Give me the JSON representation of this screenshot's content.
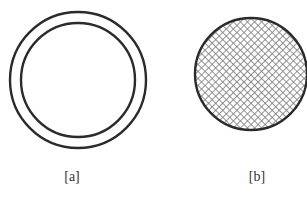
{
  "figures": [
    {
      "id": "a",
      "label": "[a]",
      "description": "two concentric unfilled circles",
      "outer_ring": {
        "cx": 78,
        "cy": 80,
        "r": 68
      },
      "inner_ring": {
        "cx": 78,
        "cy": 80,
        "r": 57
      },
      "label_pos": {
        "x": 72,
        "y": 181
      }
    },
    {
      "id": "b",
      "label": "[b]",
      "description": "solid circle filled with crosshatch pattern",
      "circle": {
        "cx": 251,
        "cy": 74,
        "r": 56
      },
      "label_pos": {
        "x": 257,
        "y": 181
      }
    }
  ],
  "colors": {
    "stroke": "#2b2b2b",
    "hatch": "#7a7a7a",
    "background": "#ffffff",
    "label": "#333333"
  }
}
